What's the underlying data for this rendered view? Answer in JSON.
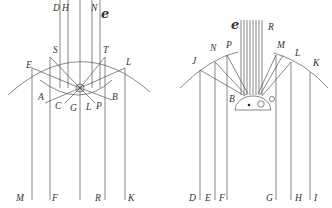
{
  "figures": {
    "left": {
      "script_label": "e",
      "labels": {
        "D": "D",
        "H": "H",
        "N": "N",
        "S": "S",
        "T": "T",
        "E": "E",
        "L": "L",
        "A": "A",
        "B": "B",
        "C": "C",
        "G": "G",
        "L2": "L",
        "P": "P",
        "M": "M",
        "F": "F",
        "R": "R",
        "K": "K"
      }
    },
    "right": {
      "script_label": "e",
      "labels": {
        "R": "R",
        "J": "J",
        "N": "N",
        "P": "P",
        "M": "M",
        "L": "L",
        "K": "K",
        "B": "B",
        "D": "D",
        "E": "E",
        "F": "F",
        "G": "G",
        "H": "H",
        "I": "I"
      }
    }
  }
}
